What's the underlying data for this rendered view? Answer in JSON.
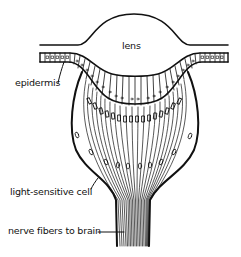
{
  "diagram": {
    "type": "anatomical-cross-section",
    "labels": {
      "lens": "lens",
      "epidermis": "epidermis",
      "light_sensitive_cell": "light-sensitive cell",
      "nerve_fibers": "nerve fibers to brain"
    },
    "colors": {
      "ink": "#111111",
      "background": "#ffffff"
    }
  }
}
